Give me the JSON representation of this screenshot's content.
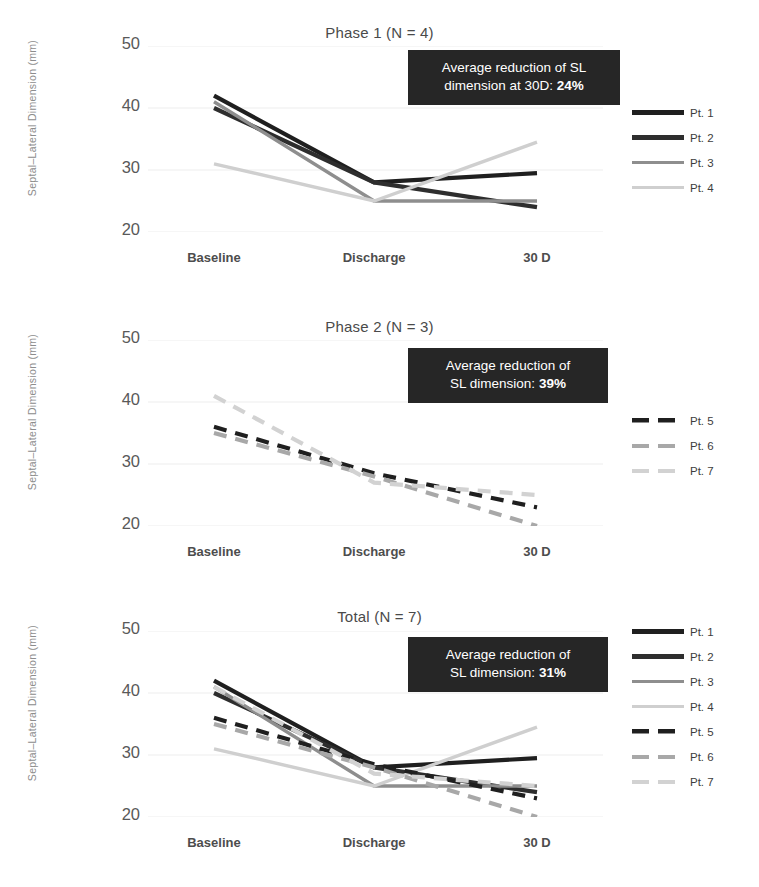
{
  "figure": {
    "ylabel": "Septal–Lateral Dimension (mm)",
    "yticks": [
      "50",
      "40",
      "30",
      "20"
    ],
    "xticks": [
      "Baseline",
      "Discharge",
      "30 D"
    ]
  },
  "colors": {
    "pt1": "#1f1f1f",
    "pt2": "#2e2e2e",
    "pt3": "#8e8e8e",
    "pt4": "#cfcfcf",
    "pt5": "#1f1f1f",
    "pt6": "#a8a8a8",
    "pt7": "#d2d2d2",
    "gridline": "#ededed",
    "annotation_bg": "#262626",
    "annotation_text": "#ffffff"
  },
  "panels": [
    {
      "id": "phase-1",
      "title": "Phase 1 (N = 4)",
      "annotation": {
        "line1": "Average reduction of SL",
        "line2_prefix": "dimension at 30D: ",
        "line2_value": "24%"
      },
      "legend": [
        {
          "label": "Pt. 1",
          "style": "solid",
          "color": "#1f1f1f",
          "width": 4.5
        },
        {
          "label": "Pt. 2",
          "style": "solid",
          "color": "#2e2e2e",
          "width": 4.5
        },
        {
          "label": "Pt. 3",
          "style": "solid",
          "color": "#8e8e8e",
          "width": 3.5
        },
        {
          "label": "Pt. 4",
          "style": "solid",
          "color": "#cfcfcf",
          "width": 3.5
        }
      ]
    },
    {
      "id": "phase-2",
      "title": "Phase 2 (N = 3)",
      "annotation": {
        "line1": "Average reduction of",
        "line2_prefix": "SL dimension: ",
        "line2_value": "39%"
      },
      "legend": [
        {
          "label": "Pt. 5",
          "style": "dashed",
          "color": "#1f1f1f",
          "width": 4.5
        },
        {
          "label": "Pt. 6",
          "style": "dashed",
          "color": "#a8a8a8",
          "width": 4
        },
        {
          "label": "Pt. 7",
          "style": "dashed",
          "color": "#d2d2d2",
          "width": 4
        }
      ]
    },
    {
      "id": "total",
      "title": "Total (N = 7)",
      "annotation": {
        "line1": "Average reduction of",
        "line2_prefix": "SL dimension: ",
        "line2_value": "31%"
      },
      "legend": [
        {
          "label": "Pt. 1",
          "style": "solid",
          "color": "#1f1f1f",
          "width": 4.5
        },
        {
          "label": "Pt. 2",
          "style": "solid",
          "color": "#2e2e2e",
          "width": 4.5
        },
        {
          "label": "Pt. 3",
          "style": "solid",
          "color": "#8e8e8e",
          "width": 3.5
        },
        {
          "label": "Pt. 4",
          "style": "solid",
          "color": "#cfcfcf",
          "width": 3.5
        },
        {
          "label": "Pt. 5",
          "style": "dashed",
          "color": "#1f1f1f",
          "width": 4.5
        },
        {
          "label": "Pt. 6",
          "style": "dashed",
          "color": "#a8a8a8",
          "width": 4
        },
        {
          "label": "Pt. 7",
          "style": "dashed",
          "color": "#d2d2d2",
          "width": 4
        }
      ]
    }
  ],
  "chart_data": [
    {
      "type": "line",
      "title": "Phase 1 (N = 4)",
      "xlabel": "",
      "ylabel": "Septal–Lateral Dimension (mm)",
      "categories": [
        "Baseline",
        "Discharge",
        "30 D"
      ],
      "ylim": [
        20,
        50
      ],
      "yticks": [
        20,
        30,
        40,
        50
      ],
      "grid": true,
      "legend_position": "right",
      "annotation": "Average reduction of SL dimension at 30D: 24%",
      "series": [
        {
          "name": "Pt. 1",
          "style": "solid",
          "color": "#1f1f1f",
          "values": [
            42.0,
            28.0,
            29.5
          ]
        },
        {
          "name": "Pt. 2",
          "style": "solid",
          "color": "#2e2e2e",
          "values": [
            40.0,
            28.0,
            24.0
          ]
        },
        {
          "name": "Pt. 3",
          "style": "solid",
          "color": "#8e8e8e",
          "values": [
            41.0,
            25.0,
            25.0
          ]
        },
        {
          "name": "Pt. 4",
          "style": "solid",
          "color": "#cfcfcf",
          "values": [
            31.0,
            25.0,
            34.5
          ]
        }
      ]
    },
    {
      "type": "line",
      "title": "Phase 2 (N = 3)",
      "xlabel": "",
      "ylabel": "Septal–Lateral Dimension (mm)",
      "categories": [
        "Baseline",
        "Discharge",
        "30 D"
      ],
      "ylim": [
        20,
        50
      ],
      "yticks": [
        20,
        30,
        40,
        50
      ],
      "grid": true,
      "legend_position": "right",
      "annotation": "Average reduction of SL dimension: 39%",
      "series": [
        {
          "name": "Pt. 5",
          "style": "dashed",
          "color": "#1f1f1f",
          "values": [
            36.0,
            28.5,
            23.0
          ]
        },
        {
          "name": "Pt. 6",
          "style": "dashed",
          "color": "#a8a8a8",
          "values": [
            35.0,
            28.0,
            20.0
          ]
        },
        {
          "name": "Pt. 7",
          "style": "dashed",
          "color": "#d2d2d2",
          "values": [
            41.0,
            27.0,
            25.0
          ]
        }
      ]
    },
    {
      "type": "line",
      "title": "Total (N = 7)",
      "xlabel": "",
      "ylabel": "Septal–Lateral Dimension (mm)",
      "categories": [
        "Baseline",
        "Discharge",
        "30 D"
      ],
      "ylim": [
        20,
        50
      ],
      "yticks": [
        20,
        30,
        40,
        50
      ],
      "grid": true,
      "legend_position": "right",
      "annotation": "Average reduction of SL dimension: 31%",
      "series": [
        {
          "name": "Pt. 1",
          "style": "solid",
          "color": "#1f1f1f",
          "values": [
            42.0,
            28.0,
            29.5
          ]
        },
        {
          "name": "Pt. 2",
          "style": "solid",
          "color": "#2e2e2e",
          "values": [
            40.0,
            28.0,
            24.0
          ]
        },
        {
          "name": "Pt. 3",
          "style": "solid",
          "color": "#8e8e8e",
          "values": [
            41.0,
            25.0,
            25.0
          ]
        },
        {
          "name": "Pt. 4",
          "style": "solid",
          "color": "#cfcfcf",
          "values": [
            31.0,
            25.0,
            34.5
          ]
        },
        {
          "name": "Pt. 5",
          "style": "dashed",
          "color": "#1f1f1f",
          "values": [
            36.0,
            28.5,
            23.0
          ]
        },
        {
          "name": "Pt. 6",
          "style": "dashed",
          "color": "#a8a8a8",
          "values": [
            35.0,
            28.0,
            20.0
          ]
        },
        {
          "name": "Pt. 7",
          "style": "dashed",
          "color": "#d2d2d2",
          "values": [
            41.0,
            27.0,
            25.0
          ]
        }
      ]
    }
  ]
}
